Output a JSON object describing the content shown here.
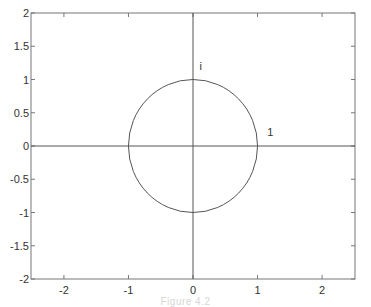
{
  "chart_data": {
    "type": "line",
    "title": "",
    "xlabel": "",
    "ylabel": "",
    "xlim": [
      -2.51,
      2.51
    ],
    "ylim": [
      -2,
      2
    ],
    "grid": false,
    "legend": null,
    "x_ticks": [
      -2,
      -1,
      0,
      1,
      2
    ],
    "x_tick_labels": [
      "-2",
      "-1",
      "0",
      "1",
      "2"
    ],
    "y_ticks": [
      -2,
      -1.5,
      -1,
      -0.5,
      0,
      0.5,
      1,
      1.5,
      2
    ],
    "y_tick_labels": [
      "-2",
      "-1.5",
      "-1",
      "-0.5",
      "0",
      "0.5",
      "1",
      "1.5",
      "2"
    ],
    "series": [
      {
        "name": "unit circle",
        "shape": "circle",
        "center": [
          0,
          0
        ],
        "radius": 1
      },
      {
        "name": "real axis",
        "x": [
          -2.51,
          2.51
        ],
        "y": [
          0,
          0
        ]
      },
      {
        "name": "imaginary axis",
        "x": [
          0,
          0
        ],
        "y": [
          -2,
          2
        ]
      }
    ],
    "annotations": [
      {
        "text": "i",
        "x": 0.1,
        "y": 1.15
      },
      {
        "text": "1",
        "x": 1.15,
        "y": 0.15
      }
    ]
  },
  "caption": "Figure 4.2"
}
